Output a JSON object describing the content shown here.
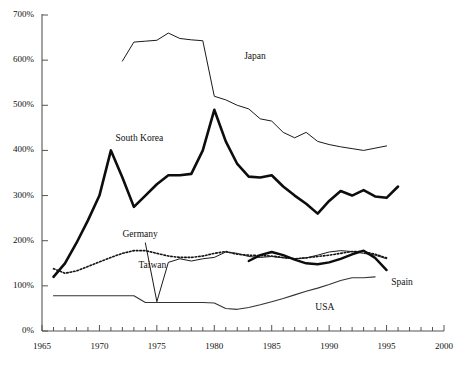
{
  "chart_data": {
    "type": "line",
    "title": "",
    "subtitle": "",
    "xlabel": "",
    "ylabel": "",
    "xlim": [
      1965,
      2000
    ],
    "ylim": [
      0,
      700
    ],
    "grid": false,
    "legend_position": "inline-annotations",
    "x_tick_labels": [
      "1965",
      "1970",
      "1975",
      "1980",
      "1985",
      "1990",
      "1995",
      "2000"
    ],
    "x_tick_values": [
      1965,
      1970,
      1975,
      1980,
      1985,
      1990,
      1995,
      2000
    ],
    "x_minor_tick_interval": 1,
    "y_tick_labels": [
      "0%",
      "100%",
      "200%",
      "300%",
      "400%",
      "500%",
      "600%",
      "700%"
    ],
    "y_tick_values": [
      0,
      100,
      200,
      300,
      400,
      500,
      600,
      700
    ],
    "annotations": [
      {
        "text": "Japan",
        "x": 1982.6,
        "y": 608
      },
      {
        "text": "South Korea",
        "x": 1971.4,
        "y": 425
      },
      {
        "text": "Germany",
        "x": 1972.0,
        "y": 213
      },
      {
        "text": "Taiwan",
        "x": 1973.4,
        "y": 143
      },
      {
        "text": "USA",
        "x": 1988.8,
        "y": 52
      },
      {
        "text": "Spain",
        "x": 1995.4,
        "y": 107
      }
    ],
    "series": [
      {
        "name": "Japan",
        "style": "thin-solid",
        "color": "#1a1a1a",
        "width": 1.0,
        "x": [
          1972,
          1973,
          1974,
          1975,
          1976,
          1977,
          1978,
          1979,
          1980,
          1981,
          1982,
          1983,
          1984,
          1985,
          1986,
          1987,
          1988,
          1989,
          1990,
          1991,
          1992,
          1993,
          1994,
          1995
        ],
        "values": [
          598,
          640,
          642,
          644,
          660,
          648,
          645,
          643,
          520,
          512,
          500,
          492,
          470,
          465,
          440,
          428,
          440,
          420,
          413,
          408,
          404,
          400,
          405,
          410
        ]
      },
      {
        "name": "South Korea",
        "style": "thick-solid",
        "color": "#0d0d0d",
        "width": 2.6,
        "x": [
          1966,
          1967,
          1968,
          1969,
          1970,
          1971,
          1972,
          1973,
          1974,
          1975,
          1976,
          1977,
          1978,
          1979,
          1980,
          1981,
          1982,
          1983,
          1984,
          1985,
          1986,
          1987,
          1988,
          1989,
          1990,
          1991,
          1992,
          1993,
          1994,
          1995,
          1996
        ],
        "values": [
          120,
          150,
          195,
          245,
          300,
          400,
          340,
          275,
          300,
          325,
          345,
          345,
          348,
          400,
          490,
          420,
          370,
          342,
          340,
          345,
          320,
          300,
          282,
          260,
          288,
          310,
          300,
          312,
          298,
          295,
          320
        ]
      },
      {
        "name": "Germany",
        "style": "dotted",
        "color": "#141414",
        "width": 1.6,
        "x": [
          1966,
          1967,
          1968,
          1969,
          1970,
          1971,
          1972,
          1973,
          1974,
          1975,
          1976,
          1977,
          1978,
          1979,
          1980,
          1981,
          1982,
          1983,
          1984,
          1985,
          1986,
          1987,
          1988,
          1989,
          1990,
          1991,
          1992,
          1993,
          1994,
          1995
        ],
        "values": [
          138,
          128,
          133,
          143,
          153,
          163,
          172,
          178,
          178,
          172,
          166,
          163,
          163,
          166,
          172,
          176,
          170,
          168,
          167,
          166,
          163,
          160,
          162,
          165,
          168,
          172,
          176,
          176,
          170,
          162
        ]
      },
      {
        "name": "Taiwan",
        "style": "thin-solid",
        "color": "#1a1a1a",
        "width": 1.0,
        "x": [
          1974,
          1975,
          1976,
          1977,
          1978,
          1979,
          1980,
          1981,
          1982,
          1983,
          1984,
          1985,
          1986,
          1987,
          1988,
          1989,
          1990,
          1991,
          1992,
          1993,
          1994,
          1995
        ],
        "values": [
          195,
          65,
          152,
          160,
          155,
          160,
          163,
          175,
          172,
          165,
          163,
          165,
          162,
          160,
          162,
          168,
          175,
          178,
          176,
          172,
          168,
          160
        ]
      },
      {
        "name": "USA",
        "style": "thin-solid",
        "color": "#333333",
        "width": 1.1,
        "x": [
          1966,
          1967,
          1968,
          1969,
          1970,
          1971,
          1972,
          1973,
          1974,
          1975,
          1976,
          1977,
          1978,
          1979,
          1980,
          1981,
          1982,
          1983,
          1984,
          1985,
          1986,
          1987,
          1988,
          1989,
          1990,
          1991,
          1992,
          1993,
          1994
        ],
        "values": [
          78,
          78,
          78,
          78,
          78,
          78,
          78,
          78,
          63,
          63,
          63,
          63,
          63,
          63,
          62,
          50,
          48,
          52,
          58,
          65,
          72,
          80,
          88,
          95,
          103,
          112,
          118,
          118,
          120
        ]
      },
      {
        "name": "Spain",
        "style": "thick-solid",
        "color": "#0d0d0d",
        "width": 2.4,
        "x": [
          1983,
          1984,
          1985,
          1986,
          1987,
          1988,
          1989,
          1990,
          1991,
          1992,
          1993,
          1994,
          1995
        ],
        "values": [
          155,
          168,
          175,
          168,
          158,
          150,
          148,
          152,
          160,
          170,
          178,
          162,
          135
        ]
      }
    ]
  },
  "axes": {
    "x_ticks": [
      "1965",
      "1970",
      "1975",
      "1980",
      "1985",
      "1990",
      "1995",
      "2000"
    ],
    "y_ticks": [
      "700%",
      "600%",
      "500%",
      "400%",
      "300%",
      "200%",
      "100%",
      "0%"
    ]
  }
}
